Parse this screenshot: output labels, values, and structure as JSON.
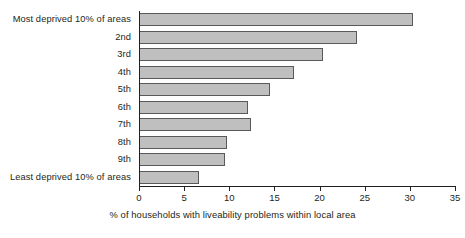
{
  "chart_data": {
    "type": "bar",
    "orientation": "horizontal",
    "title": "",
    "subtitle": "",
    "xlabel": "% of households with liveability problems within local area",
    "ylabel": "",
    "xlim": [
      0,
      35
    ],
    "xticks": [
      0,
      5,
      10,
      15,
      20,
      25,
      30,
      35
    ],
    "xtick_labels": [
      "0",
      "5",
      "10",
      "15",
      "20",
      "25",
      "30",
      "35"
    ],
    "grid": false,
    "legend": null,
    "legend_position": "none",
    "categories": [
      "Most deprived 10% of areas",
      "2nd",
      "3rd",
      "4th",
      "5th",
      "6th",
      "7th",
      "8th",
      "9th",
      "Least deprived 10% of areas"
    ],
    "values": [
      30.3,
      24.2,
      20.4,
      17.2,
      14.5,
      12.1,
      12.4,
      9.7,
      9.5,
      6.6
    ],
    "bar_color": "#bfbfbf",
    "bar_border_color": "#58595b",
    "axis_color": "#231f20"
  }
}
